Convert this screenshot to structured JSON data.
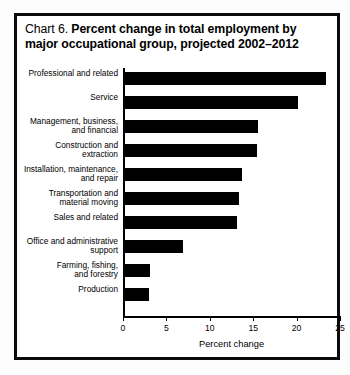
{
  "chart_data": {
    "type": "bar",
    "orientation": "horizontal",
    "title": "Chart 6.  Percent change in total employment by major occupational group, projected 2002–2012",
    "title_lines": [
      {
        "prefix": "Chart 6.",
        "bold": "Percent change in total employment by"
      },
      {
        "prefix": "",
        "bold": "major occupational group, projected 2002–2012"
      }
    ],
    "categories": [
      "Professional and related",
      "Service",
      "Management, business,\nand financial",
      "Construction and\nextraction",
      "Installation, maintenance,\nand repair",
      "Transportation and\nmaterial moving",
      "Sales and related",
      "Office and administrative\nsupport",
      "Farming, fishing,\nand forestry",
      "Production"
    ],
    "values": [
      23.3,
      20.1,
      15.4,
      15.3,
      13.6,
      13.2,
      13.0,
      6.8,
      3.0,
      2.9
    ],
    "xlabel": "Percent change",
    "ylabel": "",
    "xlim": [
      0,
      25
    ],
    "xticks": [
      0,
      5,
      10,
      15,
      20,
      25
    ],
    "xtick_labels": [
      "0",
      "5",
      "10",
      "15",
      "20",
      "25"
    ],
    "grid": false,
    "legend": false,
    "bar_color": "#000000",
    "background_color": "#ffffff",
    "frame_color": "#0a0a0a"
  }
}
